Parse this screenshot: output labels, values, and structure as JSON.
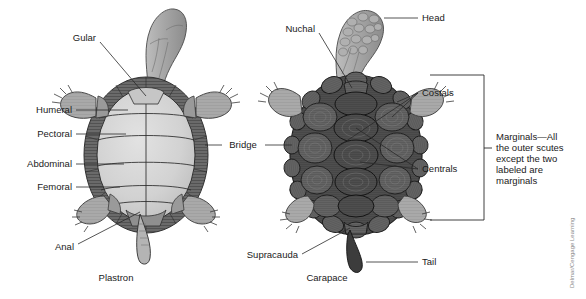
{
  "figure": {
    "credit": "Delmar/Cengage Learning",
    "captions": {
      "plastron": "Plastron",
      "carapace": "Carapace"
    }
  },
  "plastron_labels": {
    "gular": "Gular",
    "humeral": "Humeral",
    "pectoral": "Pectoral",
    "abdominal": "Abdominal",
    "femoral": "Femoral",
    "anal": "Anal"
  },
  "shared_labels": {
    "bridge": "Bridge"
  },
  "carapace_labels": {
    "nuchal": "Nuchal",
    "head": "Head",
    "costals": "Costals",
    "centrals": "Centrals",
    "tail": "Tail",
    "supracauda": "Supracauda"
  },
  "marginals_note": {
    "line1": "Marginals—All",
    "line2": "the outer scutes",
    "line3": "except the two",
    "line4": "labeled are",
    "line5": "marginals"
  },
  "colors": {
    "background": "#ffffff",
    "text": "#1a1a1a",
    "leader": "#2a2a2a",
    "plastron_fill": "#d2d2d2",
    "plastron_margin": "#5a5a5a",
    "carapace_dark": "#4a4a4a",
    "carapace_mid": "#606060",
    "limb_fill": "#a8a8a8",
    "head_fill": "#9e9e9e",
    "credit": "#8a8a8a"
  }
}
